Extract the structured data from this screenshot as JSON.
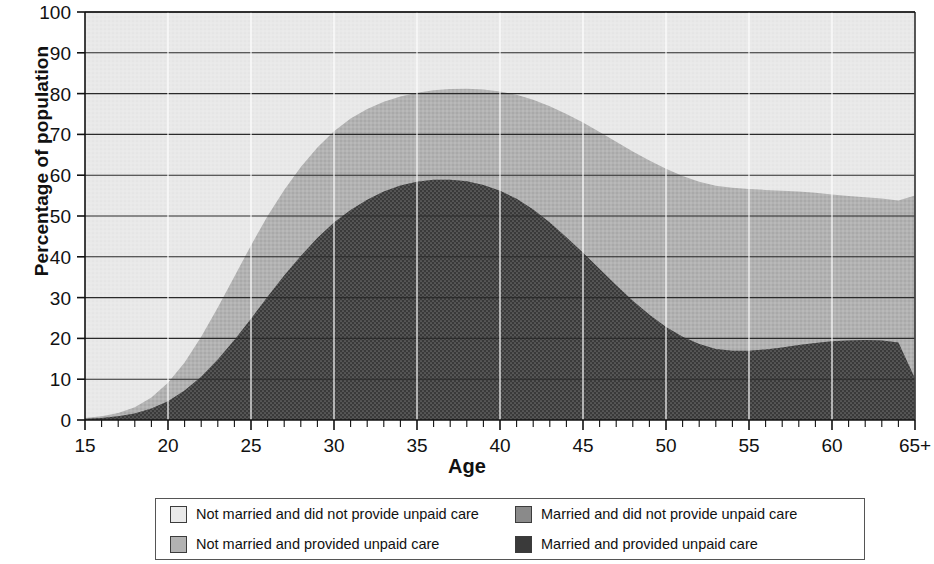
{
  "chart_data": {
    "type": "area",
    "stacked": true,
    "title": "",
    "xlabel": "Age",
    "ylabel": "Percentage of population",
    "xlim": [
      15,
      65
    ],
    "ylim": [
      0,
      100
    ],
    "ytick_step": 10,
    "yticks": [
      0,
      10,
      20,
      30,
      40,
      50,
      60,
      70,
      80,
      90,
      100
    ],
    "xticks": [
      15,
      20,
      25,
      30,
      35,
      40,
      45,
      50,
      55,
      60,
      65
    ],
    "xtick_labels": [
      "15",
      "20",
      "25",
      "30",
      "35",
      "40",
      "45",
      "50",
      "55",
      "60",
      "65+"
    ],
    "minor_xtick_step": 1,
    "grid": "horizontal",
    "legend_position": "below",
    "x": [
      15,
      16,
      17,
      18,
      19,
      20,
      21,
      22,
      23,
      24,
      25,
      26,
      27,
      28,
      29,
      30,
      31,
      32,
      33,
      34,
      35,
      36,
      37,
      38,
      39,
      40,
      41,
      42,
      43,
      44,
      45,
      46,
      47,
      48,
      49,
      50,
      51,
      52,
      53,
      54,
      55,
      56,
      57,
      58,
      59,
      60,
      61,
      62,
      63,
      64,
      65
    ],
    "series": [
      {
        "name": "Married and provided unpaid care",
        "color": "#3a3a3a",
        "values": [
          0.3,
          0.5,
          0.9,
          1.6,
          2.8,
          4.6,
          7.2,
          10.6,
          14.8,
          19.6,
          24.8,
          30.2,
          35.4,
          40.2,
          44.6,
          48.4,
          51.5,
          54.0,
          56.0,
          57.5,
          58.4,
          58.9,
          58.9,
          58.5,
          57.6,
          56.2,
          54.2,
          51.6,
          48.4,
          44.8,
          41.0,
          37.0,
          33.0,
          29.2,
          25.8,
          22.8,
          20.4,
          18.6,
          17.4,
          17.0,
          17.0,
          17.3,
          17.8,
          18.4,
          18.9,
          19.3,
          19.5,
          19.6,
          19.5,
          19.0,
          10.2
        ]
      },
      {
        "name": "Married and did not provide unpaid care",
        "color": "#8a8a8a",
        "values": [
          0.2,
          0.4,
          0.8,
          1.5,
          2.7,
          4.5,
          6.9,
          9.8,
          12.8,
          15.6,
          18.0,
          19.8,
          21.0,
          21.8,
          22.2,
          22.4,
          22.4,
          22.2,
          22.0,
          21.8,
          21.8,
          21.9,
          22.2,
          22.7,
          23.4,
          24.3,
          25.5,
          26.9,
          28.5,
          30.2,
          31.9,
          33.6,
          35.2,
          36.6,
          37.8,
          38.8,
          39.4,
          39.8,
          40.0,
          39.9,
          39.6,
          39.1,
          38.4,
          37.6,
          36.8,
          36.0,
          35.4,
          35.0,
          34.8,
          34.8,
          44.8
        ]
      },
      {
        "name": "Not married and provided unpaid care",
        "color": "#b2b2b2",
        "values": [
          9.6,
          10.0,
          10.6,
          11.4,
          12.4,
          13.5,
          14.4,
          15.0,
          15.2,
          15.0,
          14.4,
          13.6,
          12.8,
          12.2,
          11.8,
          11.6,
          11.6,
          11.8,
          12.1,
          12.5,
          12.9,
          13.3,
          13.6,
          13.8,
          13.9,
          13.8,
          13.6,
          13.3,
          12.9,
          12.4,
          11.9,
          11.4,
          11.0,
          10.6,
          10.3,
          10.1,
          10.0,
          10.0,
          10.1,
          10.3,
          10.5,
          10.7,
          10.9,
          11.1,
          11.3,
          11.4,
          11.5,
          11.5,
          11.4,
          11.2,
          11.4
        ]
      },
      {
        "name": "Not married and did not provide unpaid care",
        "color": "#e9e9e9",
        "values": [
          89.9,
          89.1,
          87.7,
          85.5,
          82.1,
          77.4,
          71.5,
          64.6,
          57.2,
          49.8,
          42.8,
          36.4,
          30.8,
          25.8,
          21.4,
          17.6,
          14.5,
          12.0,
          9.9,
          8.2,
          6.9,
          5.9,
          5.3,
          5.0,
          5.1,
          5.7,
          6.7,
          8.2,
          10.2,
          12.6,
          15.2,
          18.0,
          20.8,
          23.6,
          26.1,
          28.3,
          30.2,
          31.6,
          32.5,
          32.8,
          32.9,
          32.9,
          32.9,
          32.9,
          33.0,
          33.3,
          33.6,
          33.9,
          34.3,
          35.0,
          33.6
        ]
      }
    ],
    "stack_tops": {
      "married_provided": [
        0.3,
        0.5,
        0.9,
        1.6,
        2.8,
        4.6,
        7.2,
        10.6,
        14.8,
        19.6,
        24.8,
        30.2,
        35.4,
        40.2,
        44.6,
        48.4,
        51.5,
        54.0,
        56.0,
        57.5,
        58.4,
        58.9,
        58.9,
        58.5,
        57.6,
        56.2,
        54.2,
        51.6,
        48.4,
        44.8,
        41.0,
        37.0,
        33.0,
        29.2,
        25.8,
        22.8,
        20.4,
        18.6,
        17.4,
        17.0,
        17.0,
        17.3,
        17.8,
        18.4,
        18.9,
        19.3,
        19.5,
        19.6,
        19.5,
        19.0,
        10.2
      ],
      "plus_married_not": [
        0.5,
        0.9,
        1.7,
        3.1,
        5.5,
        9.1,
        14.1,
        20.4,
        27.6,
        35.2,
        42.8,
        50.0,
        56.4,
        62.0,
        66.8,
        70.8,
        73.9,
        76.2,
        78.0,
        79.3,
        80.2,
        80.8,
        81.1,
        81.2,
        81.0,
        80.5,
        79.7,
        78.5,
        76.9,
        75.0,
        72.9,
        70.6,
        68.2,
        65.8,
        63.6,
        61.6,
        59.8,
        58.4,
        57.4,
        56.9,
        56.6,
        56.4,
        56.2,
        56.0,
        55.7,
        55.3,
        54.9,
        54.6,
        54.3,
        53.8,
        55.0
      ],
      "plus_notmarried_provided": [
        10.1,
        10.9,
        12.3,
        14.5,
        17.9,
        22.6,
        28.5,
        35.4,
        42.8,
        50.2,
        57.2,
        63.6,
        69.2,
        74.2,
        78.6,
        82.4,
        85.5,
        88.0,
        90.1,
        91.8,
        93.1,
        94.1,
        94.7,
        95.0,
        94.9,
        94.3,
        93.3,
        91.8,
        89.8,
        87.4,
        84.8,
        82.0,
        79.2,
        76.4,
        73.9,
        71.7,
        69.8,
        68.4,
        67.5,
        67.2,
        67.1,
        67.1,
        67.1,
        67.1,
        67.0,
        66.7,
        66.4,
        66.1,
        65.7,
        65.0,
        66.4
      ]
    },
    "annotations": [
      "Peak of 'Married and provided unpaid care' is about 59% near age 37",
      "Combined married share peaks about 81% near age 38",
      "Sharp drop at the 65+ category"
    ]
  },
  "axes": {
    "y_title": "Percentage of population",
    "x_title": "Age"
  },
  "legend": {
    "items": [
      {
        "label": "Not married and did not provide unpaid care",
        "color": "#e9e9e9"
      },
      {
        "label": "Married and did not provide unpaid care",
        "color": "#8a8a8a"
      },
      {
        "label": "Not married and provided unpaid care",
        "color": "#b2b2b2"
      },
      {
        "label": "Married and provided unpaid care",
        "color": "#3a3a3a"
      }
    ]
  }
}
